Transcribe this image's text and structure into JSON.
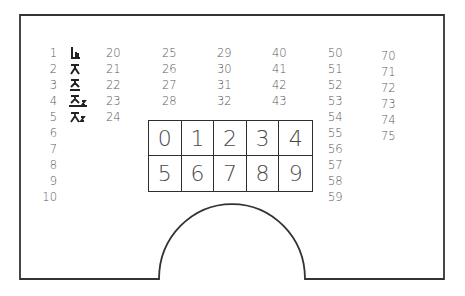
{
  "diagram": {
    "frame_color": "#333333",
    "text_color": "#5a5a5a",
    "column_1": {
      "numbers": [
        "1",
        "2",
        "3",
        "4",
        "5",
        "6",
        "7",
        "8",
        "9",
        "10"
      ],
      "icons": [
        {
          "number": "1",
          "name": "seat-icon",
          "glyph": "ꞁ"
        },
        {
          "number": "2",
          "name": "person-icon",
          "glyph": "ᄎ"
        },
        {
          "number": "3",
          "name": "seated-person-icon",
          "glyph": "ᄌ"
        },
        {
          "number": "4",
          "name": "seated-person-2-icon",
          "glyph": "ᄌ₂"
        },
        {
          "number": "5",
          "name": "person-2-icon",
          "glyph": "ᄎ₂"
        }
      ]
    },
    "column_2": [
      "20",
      "21",
      "22",
      "23",
      "24"
    ],
    "column_3": [
      "25",
      "26",
      "27",
      "28"
    ],
    "column_4": [
      "29",
      "30",
      "31",
      "32"
    ],
    "column_5": [
      "40",
      "41",
      "42",
      "43"
    ],
    "column_6": [
      "50",
      "51",
      "52",
      "53",
      "54",
      "55",
      "56",
      "57",
      "58",
      "59"
    ],
    "column_7": [
      "70",
      "71",
      "72",
      "73",
      "74",
      "75"
    ],
    "grid": {
      "row_1": [
        "0",
        "1",
        "2",
        "3",
        "4"
      ],
      "row_2": [
        "5",
        "6",
        "7",
        "8",
        "9"
      ]
    }
  }
}
